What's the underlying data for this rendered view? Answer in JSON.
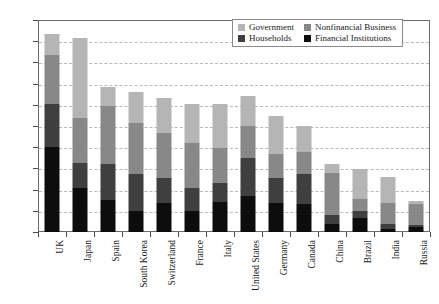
{
  "chart_data": {
    "type": "bar",
    "title": "",
    "subtitle": "",
    "xlabel": "",
    "ylabel": "",
    "stacked": true,
    "grid": true,
    "legend_position": "top-right",
    "ylim": [
      0,
      500
    ],
    "ytick_labels": [
      "0%",
      "50%",
      "100%",
      "150%",
      "200%",
      "250%",
      "300%",
      "350%",
      "400%",
      "450%",
      "500%"
    ],
    "ytick_values": [
      0,
      50,
      100,
      150,
      200,
      250,
      300,
      350,
      400,
      450,
      500
    ],
    "categories": [
      "UK",
      "Japan",
      "Spain",
      "South Korea",
      "Switzerland",
      "France",
      "Italy",
      "United States",
      "Germany",
      "Canada",
      "China",
      "Brazil",
      "India",
      "Russia"
    ],
    "series": [
      {
        "name": "Financial Institutions",
        "color": "#0d0d0d",
        "values": [
          200,
          103,
          75,
          50,
          68,
          50,
          70,
          85,
          68,
          65,
          20,
          32,
          8,
          11
        ]
      },
      {
        "name": "Households",
        "color": "#3f3f3f",
        "values": [
          103,
          60,
          85,
          88,
          60,
          55,
          45,
          90,
          60,
          71,
          20,
          17,
          10,
          5
        ]
      },
      {
        "name": "Nonfinancial Business",
        "color": "#888888",
        "values": [
          114,
          107,
          137,
          120,
          105,
          105,
          82,
          75,
          55,
          52,
          100,
          30,
          50,
          50
        ]
      },
      {
        "name": "Government",
        "color": "#b5b5b5",
        "values": [
          51,
          188,
          46,
          73,
          82,
          92,
          105,
          72,
          90,
          62,
          20,
          70,
          62,
          8
        ]
      }
    ],
    "totals": [
      468,
      458,
      343,
      331,
      315,
      302,
      302,
      322,
      273,
      250,
      160,
      149,
      130,
      74
    ]
  },
  "legend": {
    "entries": [
      {
        "label": "Government",
        "color": "#b5b5b5"
      },
      {
        "label": "Nonfinancial Business",
        "color": "#888888"
      },
      {
        "label": "Households",
        "color": "#3f3f3f"
      },
      {
        "label": "Financial Institutions",
        "color": "#0d0d0d"
      }
    ]
  }
}
